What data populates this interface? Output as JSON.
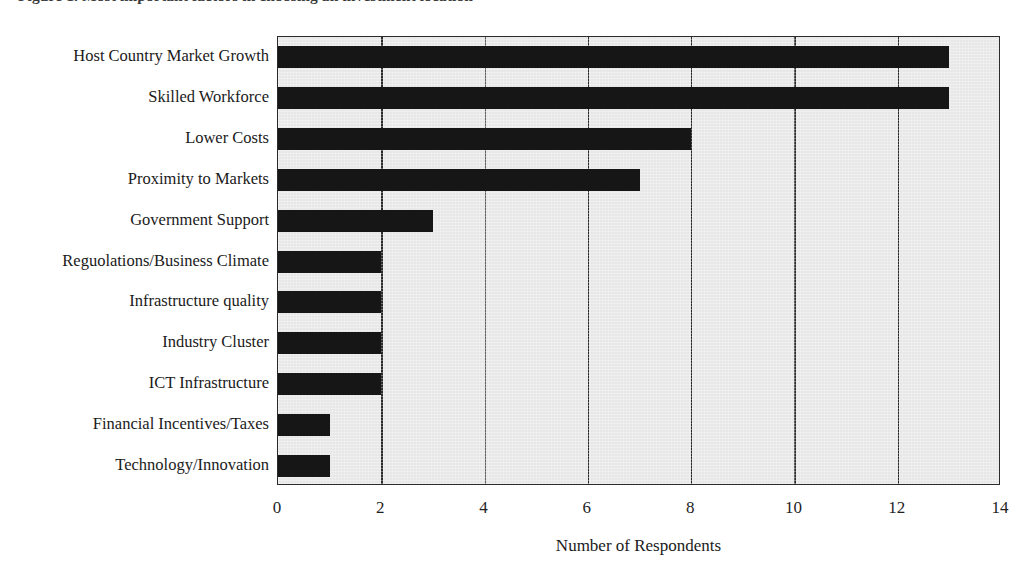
{
  "figure": {
    "caption_clipped": "Figure 1. Most important factors in choosing an investment location",
    "caption_note": "top line cropped by image edge"
  },
  "chart_data": {
    "type": "bar",
    "orientation": "horizontal",
    "title": "",
    "xlabel": "Number of Respondents",
    "ylabel": "",
    "xlim": [
      0,
      14
    ],
    "xticks": [
      0,
      2,
      4,
      6,
      8,
      10,
      12,
      14
    ],
    "xtick_labels": [
      "0",
      "2",
      "4",
      "6",
      "8",
      "10",
      "12",
      "14"
    ],
    "grid": "vertical",
    "legend": "none",
    "categories": [
      "Host Country Market Growth",
      "Skilled Workforce",
      "Lower Costs",
      "Proximity to Markets",
      "Government Support",
      "Reguolations/Business Climate",
      "Infrastructure quality",
      "Industry Cluster",
      "ICT Infrastructure",
      "Financial Incentives/Taxes",
      "Technology/Innovation"
    ],
    "values": [
      13,
      13,
      8,
      7,
      3,
      2,
      2,
      2,
      2,
      1,
      1
    ],
    "bar_color": "#161616",
    "plot_background": "#e7e7e7",
    "axis_color": "#2b2b2b",
    "page_background": "#ffffff"
  }
}
